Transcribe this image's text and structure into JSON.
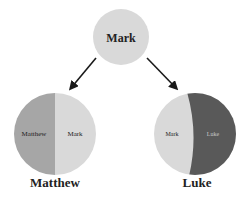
{
  "diagram": {
    "type": "synoptic-source-relationship",
    "colors": {
      "source_light": "#d9d9d9",
      "matthew_unique": "#a6a6a6",
      "luke_unique": "#595959",
      "arrow": "#1a1a1a",
      "text_dark": "#222222",
      "text_on_dark": "#c8c8c8"
    },
    "source_node": {
      "label": "Mark"
    },
    "arrows": [
      {
        "from": "Mark",
        "to": "Matthew"
      },
      {
        "from": "Mark",
        "to": "Luke"
      }
    ],
    "derived_nodes": [
      {
        "title": "Matthew",
        "segments": [
          {
            "label": "Matthew",
            "color": "#a6a6a6",
            "position": "left"
          },
          {
            "label": "Mark",
            "color": "#d9d9d9",
            "position": "right"
          }
        ]
      },
      {
        "title": "Luke",
        "segments": [
          {
            "label": "Mark",
            "color": "#d9d9d9",
            "position": "left"
          },
          {
            "label": "Luke",
            "color": "#595959",
            "position": "right"
          }
        ]
      }
    ]
  }
}
